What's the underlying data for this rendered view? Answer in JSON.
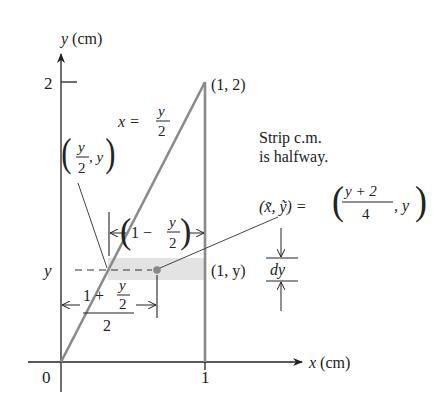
{
  "diagram": {
    "type": "center-of-mass-triangle",
    "colors": {
      "axis": "#222222",
      "region_edge": "#8a8a8a",
      "strip_fill": "#e3e3e3",
      "dot": "#888888",
      "leader": "#444444"
    },
    "axes": {
      "y_label_var": "y",
      "y_label_unit": "(cm)",
      "x_label_var": "x",
      "x_label_unit": "(cm)",
      "origin_label": "0",
      "x_tick_label": "1",
      "y_tick_label": "2",
      "strip_y_label": "y"
    },
    "labels": {
      "apex": "(1, 2)",
      "line_eq_lhs": "x =",
      "line_eq_num": "y",
      "line_eq_den": "2",
      "left_point_num": "y",
      "left_point_den": "2",
      "left_point_tail": ", y",
      "right_point": "(1, y)",
      "strip_note_line1": "Strip c.m.",
      "strip_note_line2": "is halfway.",
      "cm_lhs": "(x̃, ỹ) =",
      "cm_num": "y + 2",
      "cm_den": "4",
      "cm_tail": ", y",
      "width_dim_one": "1 −",
      "width_dim_num": "y",
      "width_dim_den": "2",
      "half_dim_num_one": "1 +",
      "half_dim_num_y": "y",
      "half_dim_num_2": "2",
      "half_dim_den": "2",
      "dy": "dy"
    }
  }
}
